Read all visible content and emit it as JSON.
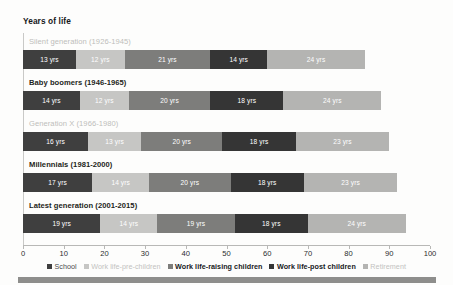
{
  "chart": {
    "title": "Years of life"
  },
  "chart_data": {
    "type": "bar",
    "orientation": "horizontal",
    "stacked": true,
    "title": "Years of life",
    "xlabel": "",
    "ylabel": "",
    "xlim": [
      0,
      100
    ],
    "grid": false,
    "legend_position": "bottom",
    "categories": [
      "Silent generation (1926-1945)",
      "Baby boomers (1946-1965)",
      "Generation X (1966-1980)",
      "Millennials (1981-2000)",
      "Latest generation (2001-2015)"
    ],
    "series": [
      {
        "name": "School",
        "color": "#3f3f3f",
        "values": [
          13,
          14,
          16,
          17,
          19
        ]
      },
      {
        "name": "Work life-pre-children",
        "color": "#c6c6c4",
        "values": [
          12,
          12,
          13,
          14,
          14
        ]
      },
      {
        "name": "Work life-raising children",
        "color": "#7d7d7b",
        "values": [
          21,
          20,
          20,
          20,
          19
        ]
      },
      {
        "name": "Work life-post children",
        "color": "#353535",
        "values": [
          14,
          18,
          18,
          18,
          18
        ]
      },
      {
        "name": "Retirement",
        "color": "#b4b4b2",
        "values": [
          24,
          24,
          23,
          23,
          24
        ]
      }
    ],
    "totals": [
      84,
      88,
      90,
      92,
      94
    ],
    "value_suffix": "yrs",
    "xticks": [
      0,
      10,
      20,
      30,
      40,
      50,
      60,
      70,
      80,
      90,
      100
    ]
  },
  "rows": [
    {
      "label": "Silent generation (1926-1945)",
      "emphasis": "faded",
      "segments": [
        {
          "label": "13 yrs",
          "value": 13,
          "color": "#3f3f3f",
          "text": "light"
        },
        {
          "label": "12 yrs",
          "value": 12,
          "color": "#c6c6c4",
          "text": "light"
        },
        {
          "label": "21 yrs",
          "value": 21,
          "color": "#7d7d7b",
          "text": "light"
        },
        {
          "label": "14 yrs",
          "value": 14,
          "color": "#353535",
          "text": "light"
        },
        {
          "label": "24 yrs",
          "value": 24,
          "color": "#b4b4b2",
          "text": "light"
        }
      ]
    },
    {
      "label": "Baby boomers (1946-1965)",
      "emphasis": "dark",
      "segments": [
        {
          "label": "14 yrs",
          "value": 14,
          "color": "#3f3f3f",
          "text": "light"
        },
        {
          "label": "12 yrs",
          "value": 12,
          "color": "#c6c6c4",
          "text": "light"
        },
        {
          "label": "20 yrs",
          "value": 20,
          "color": "#7d7d7b",
          "text": "light"
        },
        {
          "label": "18 yrs",
          "value": 18,
          "color": "#353535",
          "text": "light"
        },
        {
          "label": "24 yrs",
          "value": 24,
          "color": "#b4b4b2",
          "text": "light"
        }
      ]
    },
    {
      "label": "Generation X (1966-1980)",
      "emphasis": "faded",
      "segments": [
        {
          "label": "16 yrs",
          "value": 16,
          "color": "#3f3f3f",
          "text": "light"
        },
        {
          "label": "13 yrs",
          "value": 13,
          "color": "#c6c6c4",
          "text": "light"
        },
        {
          "label": "20 yrs",
          "value": 20,
          "color": "#7d7d7b",
          "text": "light"
        },
        {
          "label": "18 yrs",
          "value": 18,
          "color": "#353535",
          "text": "light"
        },
        {
          "label": "23 yrs",
          "value": 23,
          "color": "#b4b4b2",
          "text": "light"
        }
      ]
    },
    {
      "label": "Millennials (1981-2000)",
      "emphasis": "dark",
      "segments": [
        {
          "label": "17 yrs",
          "value": 17,
          "color": "#3f3f3f",
          "text": "light"
        },
        {
          "label": "14 yrs",
          "value": 14,
          "color": "#c6c6c4",
          "text": "light"
        },
        {
          "label": "20 yrs",
          "value": 20,
          "color": "#7d7d7b",
          "text": "light"
        },
        {
          "label": "18 yrs",
          "value": 18,
          "color": "#353535",
          "text": "light"
        },
        {
          "label": "23 yrs",
          "value": 23,
          "color": "#b4b4b2",
          "text": "light"
        }
      ]
    },
    {
      "label": "Latest generation (2001-2015)",
      "emphasis": "dark",
      "segments": [
        {
          "label": "19 yrs",
          "value": 19,
          "color": "#3f3f3f",
          "text": "light"
        },
        {
          "label": "14 yrs",
          "value": 14,
          "color": "#c6c6c4",
          "text": "light"
        },
        {
          "label": "19 yrs",
          "value": 19,
          "color": "#7d7d7b",
          "text": "light"
        },
        {
          "label": "18 yrs",
          "value": 18,
          "color": "#353535",
          "text": "light"
        },
        {
          "label": "24 yrs",
          "value": 24,
          "color": "#b4b4b2",
          "text": "light"
        }
      ]
    }
  ],
  "xaxis": {
    "ticks": [
      "0",
      "10",
      "20",
      "30",
      "40",
      "50",
      "60",
      "70",
      "80",
      "90",
      "100"
    ],
    "min": 0,
    "max": 100
  },
  "legend": [
    {
      "label": "School",
      "color": "#3f3f3f",
      "emphasis": "normal"
    },
    {
      "label": "Work life-pre-children",
      "color": "#c6c6c4",
      "emphasis": "faded"
    },
    {
      "label": "Work life-raising children",
      "color": "#7d7d7b",
      "emphasis": "strong"
    },
    {
      "label": "Work life-post children",
      "color": "#353535",
      "emphasis": "strong"
    },
    {
      "label": "Retirement",
      "color": "#b4b4b2",
      "emphasis": "faded"
    }
  ]
}
